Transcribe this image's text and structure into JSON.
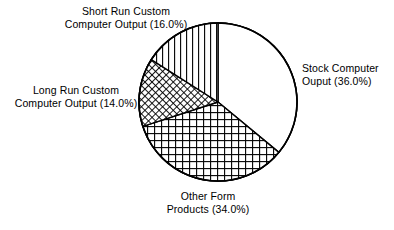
{
  "chart_data": {
    "type": "pie",
    "title": "",
    "subtitle": "",
    "xlabel": "",
    "ylabel": "",
    "legend_position": "none",
    "grid": false,
    "labels_show_percent": true,
    "total_percent": "100.0",
    "start_angle_deg": 0,
    "direction": "clockwise",
    "categories": [
      "Stock Computer Ouput",
      "Other Form Products",
      "Long Run Custom Computer Output",
      "Short Run Custom Computer Output"
    ],
    "values": [
      36.0,
      34.0,
      14.0,
      16.0
    ],
    "slices": [
      {
        "name": "stock-computer-output",
        "label_line1": "Stock Computer",
        "label_line2": "Ouput (36.0%)",
        "value": 36.0,
        "percent_text": "36.0%",
        "start_deg": 0.0,
        "end_deg": 129.6,
        "fill_pattern": "solid-white",
        "fill_color": "#ffffff",
        "stroke_color": "#000000"
      },
      {
        "name": "other-form-products",
        "label_line1": "Other Form",
        "label_line2": "Products (34.0%)",
        "value": 34.0,
        "percent_text": "34.0%",
        "start_deg": 129.6,
        "end_deg": 252.0,
        "fill_pattern": "grid-crosshatch",
        "fill_color": "#ffffff",
        "stroke_color": "#000000"
      },
      {
        "name": "long-run-custom-computer-output",
        "label_line1": "Long Run Custom",
        "label_line2": "Computer Output (14.0%)",
        "value": 14.0,
        "percent_text": "14.0%",
        "start_deg": 252.0,
        "end_deg": 302.4,
        "fill_pattern": "diagonal-crosshatch-fine",
        "fill_color": "#ffffff",
        "stroke_color": "#000000"
      },
      {
        "name": "short-run-custom-computer-output",
        "label_line1": "Short Run Custom",
        "label_line2": "Computer Output (16.0%)",
        "value": 16.0,
        "percent_text": "16.0%",
        "start_deg": 302.4,
        "end_deg": 360.0,
        "fill_pattern": "vertical-lines",
        "fill_color": "#ffffff",
        "stroke_color": "#000000"
      }
    ],
    "geometry": {
      "center_x": 218,
      "center_y": 102,
      "radius": 79
    },
    "colors": {
      "background": "#ffffff",
      "ink": "#000000"
    }
  }
}
